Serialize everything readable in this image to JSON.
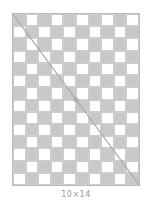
{
  "board": {
    "cols": 10,
    "rows": 14,
    "dark_color": "#c8c8c8",
    "light_color": "#ffffff",
    "top_left": "dark"
  },
  "diagonal": {
    "from": "top-left",
    "to": "bottom-right",
    "color": "#aaaaaa",
    "midpoint_marker": "circle"
  },
  "caption": "10×14"
}
